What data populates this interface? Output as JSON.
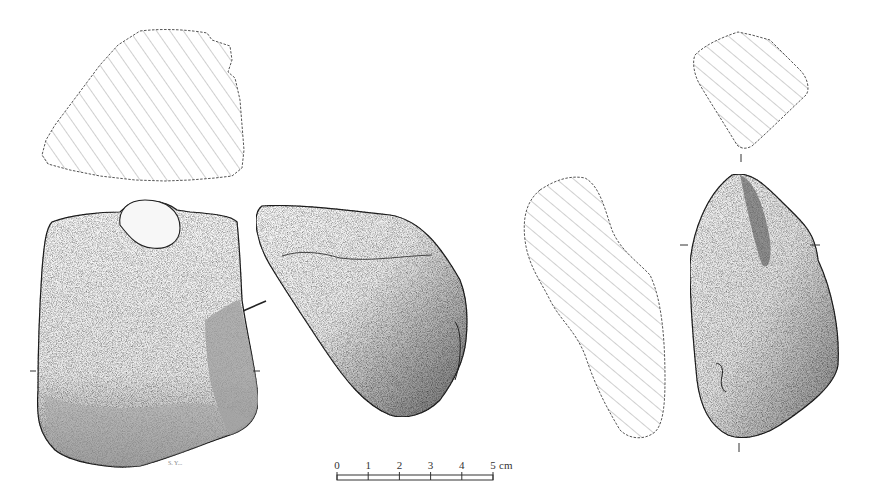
{
  "figure": {
    "type": "archaeological artifact illustration",
    "background": "#ffffff",
    "ink_color": "#222222",
    "hatch_color": "#777777"
  },
  "artifacts": [
    {
      "id": "artifact-1",
      "views": [
        "cross-section-top",
        "face-view",
        "side-view"
      ]
    },
    {
      "id": "artifact-2",
      "views": [
        "cross-section-top",
        "cross-section-side",
        "face-view"
      ]
    }
  ],
  "scale_bar": {
    "ticks": [
      "0",
      "1",
      "2",
      "3",
      "4",
      "5"
    ],
    "unit": "cm"
  },
  "signature": "S. Y..."
}
